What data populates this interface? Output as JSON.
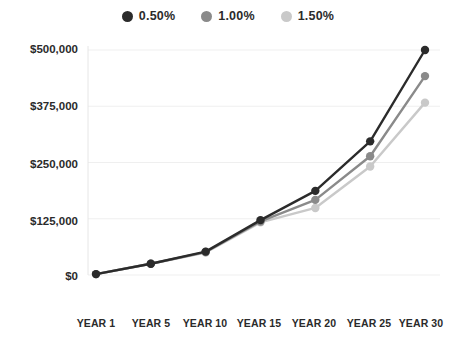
{
  "legend": {
    "position": "top-center",
    "items": [
      {
        "label": "0.50%",
        "color": "#2b2b2b",
        "swatch_icon": "circle-marker-icon"
      },
      {
        "label": "1.00%",
        "color": "#8a8a8a",
        "swatch_icon": "circle-marker-icon"
      },
      {
        "label": "1.50%",
        "color": "#c9c9c9",
        "swatch_icon": "circle-marker-icon"
      }
    ]
  },
  "axes": {
    "y_tick_labels": [
      "$500,000",
      "$375,000",
      "$250,000",
      "$125,000",
      "$0"
    ],
    "x_tick_labels": [
      "YEAR 1",
      "YEAR 5",
      "YEAR 10",
      "YEAR 15",
      "YEAR 20",
      "YEAR 25",
      "YEAR 30"
    ]
  },
  "chart_data": {
    "type": "line",
    "title": "",
    "subtitle": "",
    "xlabel": "",
    "ylabel": "",
    "categories": [
      "YEAR 1",
      "YEAR 5",
      "YEAR 10",
      "YEAR 15",
      "YEAR 20",
      "YEAR 25",
      "YEAR 30"
    ],
    "x": [
      1,
      5,
      10,
      15,
      20,
      25,
      30
    ],
    "ylim": [
      0,
      500000
    ],
    "yticks": [
      0,
      125000,
      250000,
      375000,
      500000
    ],
    "ytick_labels": [
      "$0",
      "$125,000",
      "$250,000",
      "$375,000",
      "$500,000"
    ],
    "grid": true,
    "grid_axis": "y",
    "legend_position": "top-center",
    "markers": true,
    "series": [
      {
        "name": "0.50%",
        "color": "#2b2b2b",
        "values": [
          2000,
          25000,
          52000,
          122000,
          187000,
          297000,
          500000
        ]
      },
      {
        "name": "1.00%",
        "color": "#8a8a8a",
        "values": [
          2000,
          25000,
          51000,
          119000,
          167000,
          264000,
          442000
        ]
      },
      {
        "name": "1.50%",
        "color": "#c9c9c9",
        "values": [
          2000,
          25000,
          50000,
          117000,
          149000,
          241000,
          383000
        ]
      }
    ]
  },
  "colors": {
    "gridline": "#efefef",
    "axis_line": "#e6e6e6",
    "text": "#2b2b2b",
    "background": "#ffffff"
  }
}
